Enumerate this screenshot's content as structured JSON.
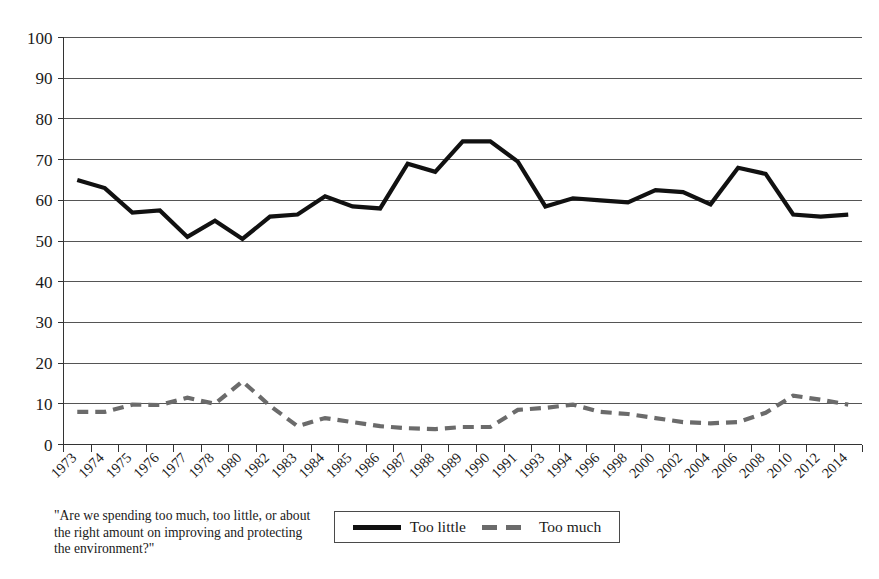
{
  "chart_data": {
    "type": "line",
    "title": "",
    "xlabel": "",
    "ylabel": "",
    "ylim": [
      0,
      100
    ],
    "ytick_step": 10,
    "grid": true,
    "legend_position": "bottom-center",
    "categories": [
      "1973",
      "1974",
      "1975",
      "1976",
      "1977",
      "1978",
      "1980",
      "1982",
      "1983",
      "1984",
      "1985",
      "1986",
      "1987",
      "1988",
      "1989",
      "1990",
      "1991",
      "1993",
      "1994",
      "1996",
      "1998",
      "2000",
      "2002",
      "2004",
      "2006",
      "2008",
      "2010",
      "2012",
      "2014"
    ],
    "yticks": [
      "0",
      "10",
      "20",
      "30",
      "40",
      "50",
      "60",
      "70",
      "80",
      "90",
      "100"
    ],
    "series": [
      {
        "name": "Too little",
        "style": "solid",
        "color": "#111111",
        "values": [
          65,
          63,
          57,
          57.5,
          51,
          55,
          50.5,
          56,
          56.5,
          61,
          58.5,
          58,
          69,
          67,
          74.5,
          74.5,
          69.5,
          58.5,
          60.5,
          60,
          59.5,
          62.5,
          62,
          59,
          68,
          66.5,
          56.5,
          56,
          56.5
        ]
      },
      {
        "name": "Too much",
        "style": "dashed",
        "color": "#6b6b6b",
        "values": [
          8,
          8,
          9.8,
          9.7,
          11.5,
          10,
          15.5,
          9.5,
          4.5,
          6.5,
          5.5,
          4.5,
          4,
          3.8,
          4.3,
          4.3,
          8.5,
          9,
          9.8,
          8,
          7.5,
          6.5,
          5.5,
          5.2,
          5.5,
          7.8,
          12,
          11,
          9.8
        ]
      }
    ],
    "caption": "\"Are we spending too much, too little, or about the right amount on improving and protecting the environment?\""
  },
  "legend": {
    "entries": [
      {
        "label": "Too little"
      },
      {
        "label": "Too much"
      }
    ]
  }
}
